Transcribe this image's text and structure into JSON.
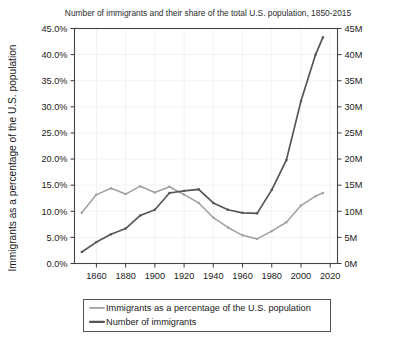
{
  "chart_data": {
    "type": "line",
    "title": "Number of immigrants and their share of the total U.S. population, 1850-2015",
    "xlabel": "",
    "ylabel": "Immigrants as a percentage of the U.S. population",
    "ylabel_right": "",
    "xlim": [
      1845,
      2025
    ],
    "ylim": [
      0,
      45
    ],
    "ylim_right": [
      0,
      45
    ],
    "grid": true,
    "legend_position": "below",
    "x_ticks": [
      1860,
      1880,
      1900,
      1920,
      1940,
      1960,
      1980,
      2000,
      2020
    ],
    "x_tick_labels": [
      "1860",
      "1880",
      "1900",
      "1920",
      "1940",
      "1960",
      "1980",
      "2000",
      "2020"
    ],
    "y_ticks_left": [
      0,
      5,
      10,
      15,
      20,
      25,
      30,
      35,
      40,
      45
    ],
    "y_tick_labels_left": [
      "0.0%",
      "5.0%",
      "10.0%",
      "15.0%",
      "20.0%",
      "25.0%",
      "30.0%",
      "35.0%",
      "40.0%",
      "45.0%"
    ],
    "y_ticks_right": [
      0,
      5,
      10,
      15,
      20,
      25,
      30,
      35,
      40,
      45
    ],
    "y_tick_labels_right": [
      "0M",
      "5M",
      "10M",
      "15M",
      "20M",
      "25M",
      "30M",
      "35M",
      "40M",
      "45M"
    ],
    "x": [
      1850,
      1860,
      1870,
      1880,
      1890,
      1900,
      1910,
      1920,
      1930,
      1940,
      1950,
      1960,
      1970,
      1980,
      1990,
      2000,
      2010,
      2015
    ],
    "series": [
      {
        "name": "Immigrants as a percentage of the U.S. population",
        "axis": "left",
        "color": "#a0a0a0",
        "unit": "%",
        "values": [
          9.7,
          13.2,
          14.4,
          13.3,
          14.8,
          13.6,
          14.7,
          13.2,
          11.6,
          8.8,
          6.9,
          5.4,
          4.7,
          6.2,
          7.9,
          11.1,
          12.9,
          13.5
        ]
      },
      {
        "name": "Number of immigrants",
        "axis": "right",
        "color": "#555555",
        "unit": "M",
        "values": [
          2.2,
          4.1,
          5.6,
          6.7,
          9.2,
          10.3,
          13.5,
          13.9,
          14.2,
          11.6,
          10.3,
          9.7,
          9.6,
          14.1,
          19.8,
          31.1,
          40.0,
          43.3
        ]
      }
    ],
    "legend": [
      {
        "label": "Immigrants as a percentage of the U.S. population",
        "color": "#a0a0a0"
      },
      {
        "label": "Number of immigrants",
        "color": "#555555"
      }
    ]
  }
}
